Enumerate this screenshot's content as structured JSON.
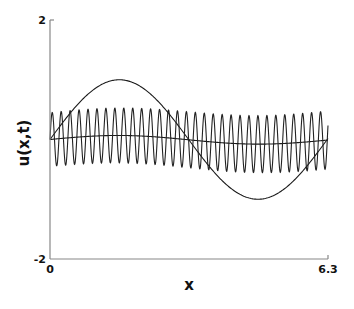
{
  "chart_data": {
    "type": "line",
    "title": "",
    "xlabel": "x",
    "ylabel": "u(x,t)",
    "xlim": [
      0,
      6.3
    ],
    "ylim": [
      -2,
      2
    ],
    "x_ticks": [
      {
        "value": 0,
        "label": "0"
      },
      {
        "value": 6.3,
        "label": "6.3"
      }
    ],
    "y_ticks": [
      {
        "value": 2,
        "label": "2"
      },
      {
        "value": -2,
        "label": "-2"
      }
    ],
    "grid": false,
    "legend": null,
    "series": [
      {
        "name": "sine",
        "formula": "sin(x)",
        "amplitude": 1.0,
        "color": "#1a1a1a"
      },
      {
        "name": "slow-mode",
        "formula": "0.07*sin(x) approx",
        "amplitude": 0.07,
        "color": "#1a1a1a"
      },
      {
        "name": "fast-oscillation",
        "formula": "slow-mode + ~0.45*sin(31x)",
        "amplitude": 0.45,
        "cycles": 31,
        "color": "#222222"
      }
    ]
  },
  "axes": {
    "x_label": "x",
    "y_label": "u(x,t)",
    "x_min_label": "0",
    "x_max_label": "6.3",
    "y_min_label": "-2",
    "y_max_label": "2"
  }
}
